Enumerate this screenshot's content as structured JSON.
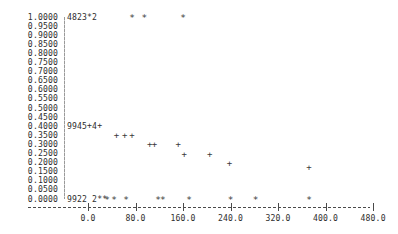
{
  "chart_data": {
    "type": "scatter",
    "title": "",
    "subtitle": "",
    "xlabel": "",
    "ylabel": "",
    "xlim": [
      -40,
      520
    ],
    "ylim": [
      0.0,
      1.0
    ],
    "grid": false,
    "legend_position": "none",
    "render_mode": "character-cell text plot",
    "y_tick_labels": [
      "1.0000",
      "0.9500",
      "0.9000",
      "0.8500",
      "0.8000",
      "0.7500",
      "0.7000",
      "0.6500",
      "0.6000",
      "0.5500",
      "0.5000",
      "0.4500",
      "0.4000",
      "0.3500",
      "0.3000",
      "0.2500",
      "0.2000",
      "0.1500",
      "0.1000",
      "0.0500",
      "0.0000"
    ],
    "y_tick_values": [
      1.0,
      0.95,
      0.9,
      0.85,
      0.8,
      0.75,
      0.7,
      0.65,
      0.6,
      0.55,
      0.5,
      0.45,
      0.4,
      0.35,
      0.3,
      0.25,
      0.2,
      0.15,
      0.1,
      0.05,
      0.0
    ],
    "x_tick_labels": [
      "0.0",
      "80.0",
      "160.0",
      "240.0",
      "320.0",
      "400.0",
      "480.0"
    ],
    "x_tick_values": [
      0,
      80,
      160,
      240,
      320,
      400,
      480
    ],
    "overplot_labels": [
      {
        "text": "4823*2",
        "y": 1.0,
        "note": "overplot counts at left edge of y=1.0000 row"
      },
      {
        "text": "9945+4+",
        "y": 0.4,
        "note": "overplot counts at left edge of y=0.4000 row"
      },
      {
        "text": "9922 2**",
        "y": 0.0,
        "note": "overplot counts at left edge of y=0.0000 row"
      }
    ],
    "series": [
      {
        "name": "upper-saturated",
        "marker": "*",
        "points": [
          {
            "x": 74,
            "y": 1.0
          },
          {
            "x": 95,
            "y": 1.0
          },
          {
            "x": 160,
            "y": 1.0
          }
        ]
      },
      {
        "name": "mid-band",
        "marker": "+",
        "points": [
          {
            "x": 48,
            "y": 0.35
          },
          {
            "x": 62,
            "y": 0.35
          },
          {
            "x": 74,
            "y": 0.35
          },
          {
            "x": 104,
            "y": 0.3
          },
          {
            "x": 112,
            "y": 0.3
          },
          {
            "x": 152,
            "y": 0.3
          },
          {
            "x": 162,
            "y": 0.25
          },
          {
            "x": 205,
            "y": 0.25
          },
          {
            "x": 238,
            "y": 0.2
          },
          {
            "x": 372,
            "y": 0.175
          }
        ]
      },
      {
        "name": "lower-saturated",
        "marker": "*",
        "points": [
          {
            "x": 32,
            "y": 0.0
          },
          {
            "x": 44,
            "y": 0.0
          },
          {
            "x": 64,
            "y": 0.0
          },
          {
            "x": 118,
            "y": 0.0
          },
          {
            "x": 126,
            "y": 0.0
          },
          {
            "x": 170,
            "y": 0.0
          },
          {
            "x": 240,
            "y": 0.0
          },
          {
            "x": 282,
            "y": 0.0
          },
          {
            "x": 372,
            "y": 0.0
          }
        ]
      }
    ]
  },
  "colors": {
    "background": "#ffffff",
    "text": "#2e2e2e",
    "marker": "#3a3a3a",
    "axis": "#4a4a4a",
    "y_axis_rule": "#9a9a9a"
  }
}
